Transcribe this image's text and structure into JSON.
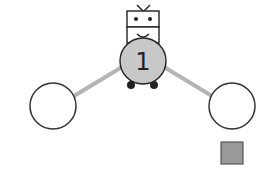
{
  "diagram": {
    "robot": {
      "label": "1",
      "body_color": "#c8c8c8"
    },
    "nodes": [
      {
        "id": "left-node",
        "fill": "#ffffff"
      },
      {
        "id": "right-node",
        "fill": "#ffffff"
      }
    ],
    "edge_color": "#b4b4b4",
    "marker": {
      "shape": "square",
      "color": "#999999"
    }
  }
}
